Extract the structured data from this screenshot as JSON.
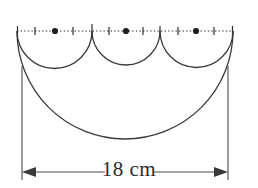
{
  "figure": {
    "dimension_label": "18 cm",
    "baseline": {
      "style": "dotted",
      "x_start": 17,
      "x_end": 233,
      "y": 31,
      "tick_count": 13,
      "tick_half_height": 4,
      "end_tick_half_height": 6
    },
    "centers": [
      {
        "name": "center-1",
        "x": 55,
        "y": 31
      },
      {
        "name": "center-2",
        "x": 126,
        "y": 31
      },
      {
        "name": "center-3",
        "x": 196,
        "y": 31
      }
    ],
    "small_semicircles": [
      {
        "name": "small-arc-1",
        "x_start": 17,
        "x_end": 92,
        "radius": 37.5
      },
      {
        "name": "small-arc-2",
        "x_start": 92,
        "x_end": 160,
        "radius": 34
      },
      {
        "name": "small-arc-3",
        "x_start": 160,
        "x_end": 233,
        "radius": 36.5
      }
    ],
    "large_semicircle": {
      "name": "large-arc",
      "x_start": 17,
      "x_end": 233,
      "radius": 108,
      "bottom_y": 145
    },
    "extension_lines": [
      {
        "name": "extension-line-left",
        "x": 22,
        "y_top": 66,
        "y_bottom": 180
      },
      {
        "name": "extension-line-right",
        "x": 228,
        "y_top": 66,
        "y_bottom": 180
      }
    ],
    "dimension_line": {
      "name": "dimension-line",
      "y": 172,
      "x_start": 22,
      "x_end": 228,
      "arrow_length": 13,
      "arrow_half_width": 5
    },
    "colors": {
      "stroke": "#3a3a3a",
      "dotted": "#2e2e2e",
      "dot": "#1f1f1f",
      "text": "#2b2b2b",
      "background": "#ffffff"
    }
  }
}
